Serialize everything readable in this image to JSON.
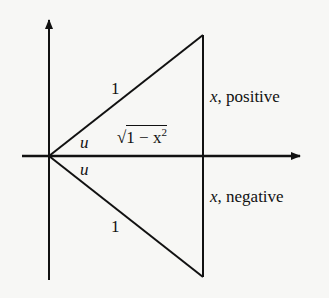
{
  "diagram": {
    "colors": {
      "stroke": "#111111",
      "background": "#f7f7f5"
    },
    "axes": {
      "vertical": {
        "x": 49,
        "y_top": 18,
        "y_bottom": 280,
        "arrow": "up"
      },
      "horizontal": {
        "y": 156,
        "x_left": 22,
        "x_right": 302,
        "arrow": "right"
      }
    },
    "triangles": [
      {
        "name": "upper",
        "points": [
          [
            49,
            156
          ],
          [
            203,
            35
          ],
          [
            203,
            156
          ]
        ]
      },
      {
        "name": "lower",
        "points": [
          [
            49,
            156
          ],
          [
            203,
            277
          ],
          [
            203,
            156
          ]
        ]
      }
    ],
    "labels": {
      "hyp_upper": "1",
      "hyp_lower": "1",
      "angle_upper": "u",
      "angle_lower": "u",
      "adjacent_radicand": "1 − x",
      "adjacent_exponent": "2",
      "adjacent_radical": "√",
      "side_upper_var": "x",
      "side_upper_text": ", positive",
      "side_lower_var": "x",
      "side_lower_text": ", negative"
    }
  }
}
